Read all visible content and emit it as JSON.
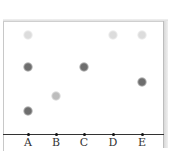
{
  "diagram": {
    "type": "thin-layer-chromatography-plate",
    "lanes": [
      {
        "label": "A",
        "x": 28,
        "spots": [
          {
            "y": 35,
            "intensity": "light",
            "color": "#dcdcdc"
          },
          {
            "y": 67,
            "intensity": "dark",
            "color": "#6e6e6e"
          },
          {
            "y": 111,
            "intensity": "dark",
            "color": "#6e6e6e"
          }
        ]
      },
      {
        "label": "B",
        "x": 56,
        "spots": [
          {
            "y": 96,
            "intensity": "medium",
            "color": "#bdbdbd"
          }
        ]
      },
      {
        "label": "C",
        "x": 84,
        "spots": [
          {
            "y": 67,
            "intensity": "dark",
            "color": "#6e6e6e"
          }
        ]
      },
      {
        "label": "D",
        "x": 113,
        "spots": [
          {
            "y": 35,
            "intensity": "light",
            "color": "#dcdcdc"
          }
        ]
      },
      {
        "label": "E",
        "x": 142,
        "spots": [
          {
            "y": 35,
            "intensity": "light",
            "color": "#dcdcdc"
          },
          {
            "y": 82,
            "intensity": "dark",
            "color": "#6e6e6e"
          }
        ]
      }
    ]
  }
}
